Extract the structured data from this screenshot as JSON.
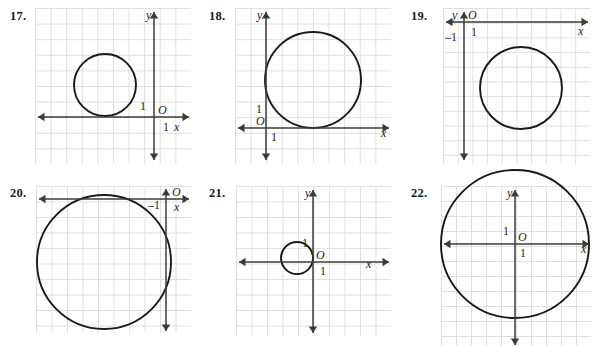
{
  "page": {
    "background": "#ffffff",
    "grid_color": "#e2dedf",
    "axis_color": "#3b3b3b",
    "curve_color": "#1a1a1a",
    "width": 605,
    "height": 346
  },
  "panels": [
    {
      "id": "p17",
      "number": "17.",
      "num_x": 10,
      "num_y": 9,
      "box": {
        "x": 35,
        "y": 8,
        "w": 156,
        "h": 156
      },
      "cell": 15.6,
      "axes": {
        "origin_x": 154,
        "origin_y": 117,
        "x_axis": {
          "x1": 38,
          "x2": 189,
          "y": 117,
          "arrow_left": true,
          "arrow_right": true
        },
        "y_axis": {
          "y1": 12,
          "y2": 160,
          "x": 154,
          "arrow_up": true,
          "arrow_down": true
        }
      },
      "labels": [
        {
          "name": "y-axis-label",
          "text": "y",
          "x": 146,
          "y": 19,
          "style": "italic"
        },
        {
          "name": "origin-label",
          "text": "O",
          "x": 158,
          "y": 114,
          "style": "italic"
        },
        {
          "name": "x-axis-label",
          "text": "x",
          "x": 174,
          "y": 131,
          "style": "italic"
        },
        {
          "name": "y-tick-one",
          "text": "1",
          "x": 140,
          "y": 110,
          "style": "roman"
        },
        {
          "name": "x-tick-one",
          "text": "1",
          "x": 163,
          "y": 131,
          "style": "roman"
        }
      ],
      "circle": {
        "cx": 105,
        "cy": 85,
        "r": 31
      }
    },
    {
      "id": "p18",
      "number": "18.",
      "num_x": 209,
      "num_y": 9,
      "box": {
        "x": 235,
        "y": 8,
        "w": 156,
        "h": 156
      },
      "cell": 15.6,
      "axes": {
        "origin_x": 266,
        "origin_y": 128,
        "x_axis": {
          "x1": 238,
          "x2": 389,
          "y": 128,
          "arrow_left": true,
          "arrow_right": true
        },
        "y_axis": {
          "y1": 12,
          "y2": 160,
          "x": 266,
          "arrow_up": true,
          "arrow_down": true
        }
      },
      "labels": [
        {
          "name": "y-axis-label",
          "text": "y",
          "x": 257,
          "y": 19,
          "style": "italic"
        },
        {
          "name": "origin-label",
          "text": "O",
          "x": 256,
          "y": 125,
          "style": "italic"
        },
        {
          "name": "x-axis-label",
          "text": "x",
          "x": 381,
          "y": 137,
          "style": "italic"
        },
        {
          "name": "y-tick-one",
          "text": "1",
          "x": 256,
          "y": 113,
          "style": "roman"
        },
        {
          "name": "x-tick-one",
          "text": "1",
          "x": 271,
          "y": 141,
          "style": "roman"
        }
      ],
      "circle": {
        "cx": 313,
        "cy": 80,
        "r": 48
      }
    },
    {
      "id": "p19",
      "number": "19.",
      "num_x": 411,
      "num_y": 9,
      "box": {
        "x": 443,
        "y": 8,
        "w": 147,
        "h": 156
      },
      "cell": 14.7,
      "axes": {
        "origin_x": 464,
        "origin_y": 22,
        "x_axis": {
          "x1": 446,
          "x2": 588,
          "y": 22,
          "arrow_left": true,
          "arrow_right": true
        },
        "y_axis": {
          "y1": 12,
          "y2": 160,
          "x": 464,
          "arrow_up": true,
          "arrow_down": true
        }
      },
      "labels": [
        {
          "name": "y-axis-label",
          "text": "y",
          "x": 452,
          "y": 19,
          "style": "italic"
        },
        {
          "name": "origin-label",
          "text": "O",
          "x": 468,
          "y": 19,
          "style": "italic"
        },
        {
          "name": "x-axis-label",
          "text": "x",
          "x": 578,
          "y": 35,
          "style": "italic"
        },
        {
          "name": "x-tick-one",
          "text": "1",
          "x": 471,
          "y": 36,
          "style": "roman"
        },
        {
          "name": "y-tick-neg-one",
          "text": "–1",
          "x": 445,
          "y": 41,
          "style": "roman"
        }
      ],
      "circle": {
        "cx": 521,
        "cy": 88,
        "r": 41
      }
    },
    {
      "id": "p20",
      "number": "20.",
      "num_x": 10,
      "num_y": 186,
      "box": {
        "x": 36,
        "y": 186,
        "w": 155,
        "h": 147
      },
      "cell": 15.5,
      "axes": {
        "origin_x": 166,
        "origin_y": 199,
        "x_axis": {
          "x1": 39,
          "x2": 189,
          "y": 199,
          "arrow_left": true,
          "arrow_right": true
        },
        "y_axis": {
          "y1": 189,
          "y2": 331,
          "x": 166,
          "arrow_up": true,
          "arrow_down": true
        }
      },
      "labels": [
        {
          "name": "origin-label",
          "text": "O",
          "x": 172,
          "y": 196,
          "style": "italic"
        },
        {
          "name": "x-axis-label",
          "text": "x",
          "x": 174,
          "y": 211,
          "style": "italic"
        },
        {
          "name": "x-tick-neg-one",
          "text": "–1",
          "x": 148,
          "y": 209,
          "style": "roman"
        }
      ],
      "circle": {
        "cx": 104,
        "cy": 262,
        "r": 67
      }
    },
    {
      "id": "p21",
      "number": "21.",
      "num_x": 209,
      "num_y": 186,
      "box": {
        "x": 236,
        "y": 186,
        "w": 155,
        "h": 150
      },
      "cell": 15.5,
      "axes": {
        "origin_x": 313,
        "origin_y": 262,
        "x_axis": {
          "x1": 239,
          "x2": 389,
          "y": 262,
          "arrow_left": true,
          "arrow_right": true
        },
        "y_axis": {
          "y1": 190,
          "y2": 333,
          "x": 313,
          "arrow_up": true,
          "arrow_down": true
        }
      },
      "labels": [
        {
          "name": "y-axis-label",
          "text": "y",
          "x": 305,
          "y": 197,
          "style": "italic"
        },
        {
          "name": "origin-label",
          "text": "O",
          "x": 316,
          "y": 259,
          "style": "italic"
        },
        {
          "name": "x-axis-label",
          "text": "x",
          "x": 366,
          "y": 268,
          "style": "italic"
        },
        {
          "name": "y-tick-one",
          "text": "1",
          "x": 302,
          "y": 247,
          "style": "roman"
        },
        {
          "name": "x-tick-one",
          "text": "1",
          "x": 320,
          "y": 275,
          "style": "roman"
        }
      ],
      "circle": {
        "cx": 297,
        "cy": 258,
        "r": 16
      }
    },
    {
      "id": "p22",
      "number": "22.",
      "num_x": 411,
      "num_y": 186,
      "box": {
        "x": 441,
        "y": 186,
        "w": 150,
        "h": 160
      },
      "cell": 15.0,
      "axes": {
        "origin_x": 515,
        "origin_y": 244,
        "x_axis": {
          "x1": 444,
          "x2": 589,
          "y": 244,
          "arrow_left": true,
          "arrow_right": true
        },
        "y_axis": {
          "y1": 190,
          "y2": 345,
          "x": 515,
          "arrow_up": true,
          "arrow_down": true
        }
      },
      "labels": [
        {
          "name": "y-axis-label",
          "text": "y",
          "x": 507,
          "y": 197,
          "style": "italic"
        },
        {
          "name": "origin-label",
          "text": "O",
          "x": 518,
          "y": 241,
          "style": "italic"
        },
        {
          "name": "x-axis-label",
          "text": "x",
          "x": 581,
          "y": 253,
          "style": "italic"
        },
        {
          "name": "y-tick-one",
          "text": "1",
          "x": 503,
          "y": 235,
          "style": "roman"
        },
        {
          "name": "x-tick-one",
          "text": "1",
          "x": 520,
          "y": 257,
          "style": "roman"
        }
      ],
      "circle": {
        "cx": 515,
        "cy": 244,
        "r": 74
      }
    }
  ]
}
